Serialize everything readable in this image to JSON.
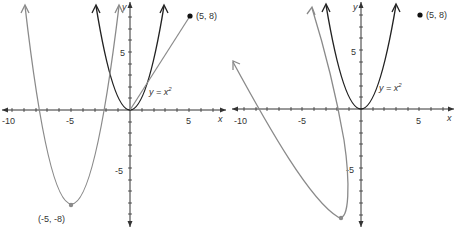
{
  "figure": {
    "panels": [
      {
        "id": "left",
        "axis_labels": {
          "x": "x",
          "y": "y"
        },
        "x_ticks": [
          {
            "value": -10,
            "label": "-10"
          },
          {
            "value": -5,
            "label": "-5"
          },
          {
            "value": 5,
            "label": "5"
          }
        ],
        "y_ticks": [
          {
            "value": 5,
            "label": "5"
          },
          {
            "value": -5,
            "label": "-5"
          }
        ],
        "curve_label": "y = x",
        "curve_label_exp": "2",
        "point_label": "(5, 8)",
        "vertex_label": "(-5, -8)"
      },
      {
        "id": "right",
        "axis_labels": {
          "x": "x",
          "y": "y"
        },
        "x_ticks": [
          {
            "value": -10,
            "label": "-10"
          },
          {
            "value": -5,
            "label": "-5"
          },
          {
            "value": 5,
            "label": "5"
          }
        ],
        "y_ticks": [
          {
            "value": 5,
            "label": "5"
          },
          {
            "value": -5,
            "label": "-5"
          }
        ],
        "curve_label": "y = x",
        "curve_label_exp": "2",
        "point_label": "(5, 8)"
      }
    ],
    "colors": {
      "axis": "#333333",
      "parent_curve": "#222222",
      "transformed_curve": "#8a8a8a",
      "point": "#111111"
    }
  }
}
